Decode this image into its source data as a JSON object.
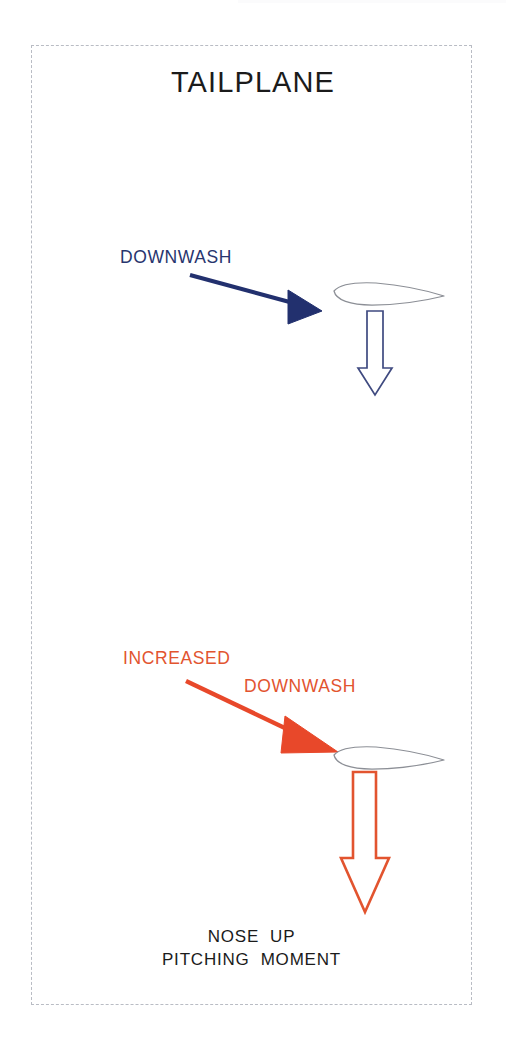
{
  "diagram": {
    "title": "TAILPLANE",
    "frame": {
      "style": "dashed",
      "color": "#b9bcc4"
    },
    "colors": {
      "navy": "#28356e",
      "navy_fill": "#22306e",
      "orange": "#e2542f",
      "orange_fill": "#e8482a",
      "airfoil_outline": "#8c8f96",
      "text_black": "#1b1b1b"
    },
    "panels": [
      {
        "id": "normal-condition",
        "label": "DOWNWASH",
        "label_color": "#28356e",
        "flow_arrow": {
          "name": "downwash-flow-arrow",
          "style": "solid-filled",
          "color": "#22306e",
          "direction": "down-right"
        },
        "airfoil": {
          "name": "tailplane-airfoil",
          "outline_color": "#8c8f96",
          "orientation": "leading-edge-left"
        },
        "force_arrow": {
          "name": "tailplane-load-arrow",
          "style": "hollow-outline",
          "color": "#28356e",
          "direction": "down",
          "magnitude": "normal"
        }
      },
      {
        "id": "increased-condition",
        "label_line_1": "INCREASED",
        "label_line_2": "DOWNWASH",
        "label_color": "#e2542f",
        "flow_arrow": {
          "name": "increased-downwash-flow-arrow",
          "style": "solid-filled",
          "color": "#e8482a",
          "direction": "down-right"
        },
        "airfoil": {
          "name": "tailplane-airfoil",
          "outline_color": "#8c8f96",
          "orientation": "leading-edge-left"
        },
        "force_arrow": {
          "name": "tailplane-increased-load-arrow",
          "style": "hollow-outline",
          "color": "#e2542f",
          "direction": "down",
          "magnitude": "increased"
        }
      }
    ],
    "caption_line_1": "NOSE  UP",
    "caption_line_2": "PITCHING  MOMENT"
  }
}
